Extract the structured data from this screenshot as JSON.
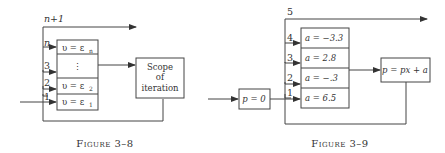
{
  "figures": [
    {
      "caption": "Figure 3–8",
      "loop_label": "n+1",
      "entry_labels": [
        "n",
        "3",
        "2",
        "1"
      ],
      "cells": [
        "υ = ε",
        "⋮",
        "υ = ε",
        "υ = ε"
      ],
      "cell_subscripts": [
        "n",
        "",
        "2",
        "1"
      ],
      "scope_box": [
        "Scope",
        "of",
        "iteration"
      ]
    },
    {
      "caption": "Figure 3–9",
      "loop_label": "5",
      "entry_labels": [
        "4",
        "3",
        "2",
        "1"
      ],
      "init_box": "p = 0",
      "cells": [
        "a = −3.3",
        "a = 2.8",
        "a = −.3",
        "a = 6.5"
      ],
      "update_box": "p = px + a"
    }
  ]
}
